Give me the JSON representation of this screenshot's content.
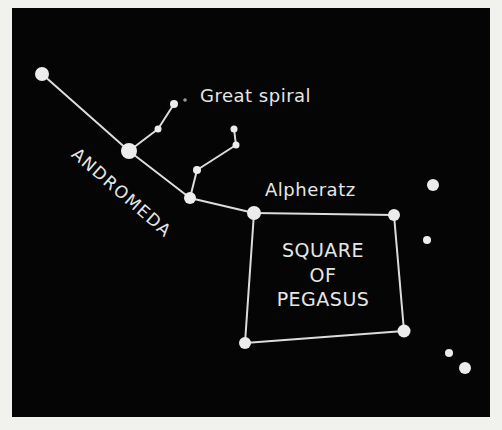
{
  "colors": {
    "page_background": "#f1f1ee",
    "panel_background": "#050505",
    "star_fill": "#ececec",
    "line_color": "#dcdcdc",
    "label_color": "#e6e6e6"
  },
  "panel": {
    "x": 12,
    "y": 8,
    "width": 478,
    "height": 409
  },
  "labels": {
    "great_spiral": "Great spiral",
    "andromeda": "ANDROMEDA",
    "alpheratz": "Alpheratz",
    "square_line1": "SQUARE",
    "square_line2": "OF",
    "square_line3": "PEGASUS"
  },
  "stars": [
    {
      "id": "and-1",
      "x": 42,
      "y": 74,
      "r": 7
    },
    {
      "id": "and-2",
      "x": 129,
      "y": 151,
      "r": 8
    },
    {
      "id": "and-3",
      "x": 190,
      "y": 198,
      "r": 6
    },
    {
      "id": "alpheratz",
      "x": 254,
      "y": 213,
      "r": 7
    },
    {
      "id": "branch1-a",
      "x": 158,
      "y": 129,
      "r": 3.5
    },
    {
      "id": "branch1-b",
      "x": 174,
      "y": 104,
      "r": 4
    },
    {
      "id": "branch2-a",
      "x": 197,
      "y": 170,
      "r": 4
    },
    {
      "id": "branch2-b",
      "x": 236,
      "y": 145,
      "r": 3.5
    },
    {
      "id": "branch2-c",
      "x": 234,
      "y": 129,
      "r": 3.5
    },
    {
      "id": "peg-ne",
      "x": 394,
      "y": 215,
      "r": 6
    },
    {
      "id": "peg-se",
      "x": 404,
      "y": 331,
      "r": 6.5
    },
    {
      "id": "peg-sw",
      "x": 245,
      "y": 343,
      "r": 6
    },
    {
      "id": "field-1",
      "x": 433,
      "y": 185,
      "r": 6
    },
    {
      "id": "field-2",
      "x": 427,
      "y": 240,
      "r": 4
    },
    {
      "id": "field-3",
      "x": 449,
      "y": 353,
      "r": 4
    },
    {
      "id": "field-4",
      "x": 465,
      "y": 368,
      "r": 6
    }
  ],
  "great_spiral_marker": {
    "x": 185,
    "y": 100,
    "r": 1.8
  },
  "lines": [
    [
      "and-1",
      "and-2"
    ],
    [
      "and-2",
      "and-3"
    ],
    [
      "and-3",
      "alpheratz"
    ],
    [
      "and-2",
      "branch1-a"
    ],
    [
      "branch1-a",
      "branch1-b"
    ],
    [
      "and-3",
      "branch2-a"
    ],
    [
      "branch2-a",
      "branch2-b"
    ],
    [
      "branch2-b",
      "branch2-c"
    ],
    [
      "alpheratz",
      "peg-ne"
    ],
    [
      "peg-ne",
      "peg-se"
    ],
    [
      "peg-se",
      "peg-sw"
    ],
    [
      "peg-sw",
      "alpheratz"
    ]
  ]
}
